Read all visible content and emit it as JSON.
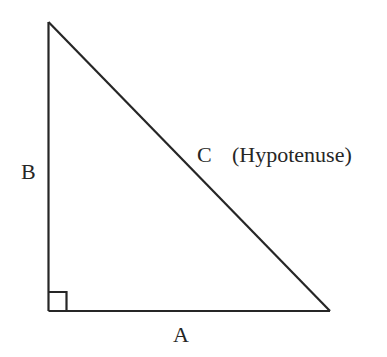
{
  "diagram": {
    "type": "right-triangle",
    "vertices": {
      "top": [
        48.5,
        22
      ],
      "bottom_left": [
        48.5,
        311
      ],
      "bottom_right": [
        330,
        311
      ]
    },
    "right_angle_marker": {
      "x": 48.5,
      "y": 292,
      "size": 19
    },
    "stroke_color": "#262626",
    "labels": {
      "side_a": "A",
      "side_b": "B",
      "side_c": "C",
      "hypotenuse_note": "(Hypotenuse)"
    }
  }
}
